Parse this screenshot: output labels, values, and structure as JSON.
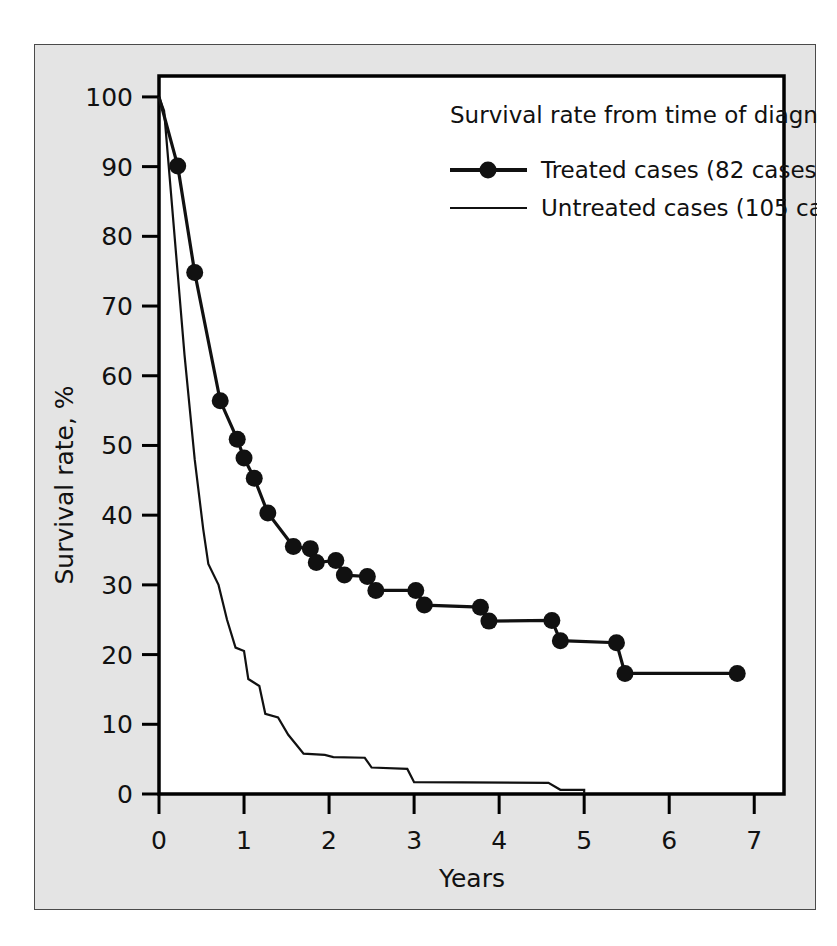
{
  "figure": {
    "background_color": "#e4e4e4",
    "border_color": "#4a4a4a",
    "plot_background": "#ffffff"
  },
  "chart_data": {
    "type": "line",
    "title": "",
    "xlabel": "Years",
    "ylabel": "Survival rate, %",
    "xlim": [
      0,
      7.35
    ],
    "ylim": [
      0,
      103
    ],
    "xticks": [
      0,
      1,
      2,
      3,
      4,
      5,
      6,
      7
    ],
    "xticklabels": [
      "0",
      "1",
      "2",
      "3",
      "4",
      "5",
      "6",
      "7"
    ],
    "yticks": [
      0,
      10,
      20,
      30,
      40,
      50,
      60,
      70,
      80,
      90,
      100
    ],
    "yticklabels": [
      "0",
      "10",
      "20",
      "30",
      "40",
      "50",
      "60",
      "70",
      "80",
      "90",
      "100"
    ],
    "grid": false,
    "legend": {
      "title": "Survival rate from time of diagnosis",
      "position": "upper-right",
      "entries": [
        {
          "label": "Treated cases (82 cases)",
          "marker": "filled-circle",
          "line": "solid-thick",
          "color": "#111111"
        },
        {
          "label": "Untreated cases (105 cases)",
          "marker": "none",
          "line": "solid-thin",
          "color": "#111111"
        }
      ]
    },
    "series": [
      {
        "name": "Treated cases (82 cases)",
        "n_cases": 82,
        "marker": "filled-circle",
        "points": [
          [
            0.0,
            100.0
          ],
          [
            0.22,
            90.1
          ],
          [
            0.42,
            74.8
          ],
          [
            0.72,
            56.4
          ],
          [
            0.92,
            50.9
          ],
          [
            1.0,
            48.2
          ],
          [
            1.12,
            45.3
          ],
          [
            1.28,
            40.3
          ],
          [
            1.58,
            35.5
          ],
          [
            1.78,
            35.2
          ],
          [
            1.85,
            33.2
          ],
          [
            2.08,
            33.5
          ],
          [
            2.18,
            31.4
          ],
          [
            2.45,
            31.2
          ],
          [
            2.55,
            29.2
          ],
          [
            3.02,
            29.2
          ],
          [
            3.12,
            27.1
          ],
          [
            3.78,
            26.8
          ],
          [
            3.88,
            24.8
          ],
          [
            4.62,
            24.9
          ],
          [
            4.72,
            22.0
          ],
          [
            5.38,
            21.7
          ],
          [
            5.48,
            17.3
          ],
          [
            6.8,
            17.3
          ]
        ]
      },
      {
        "name": "Untreated cases (105 cases)",
        "n_cases": 105,
        "marker": "none",
        "points": [
          [
            0.0,
            100.0
          ],
          [
            0.06,
            98.0
          ],
          [
            0.3,
            63.0
          ],
          [
            0.42,
            48.0
          ],
          [
            0.52,
            38.0
          ],
          [
            0.58,
            33.0
          ],
          [
            0.7,
            30.0
          ],
          [
            0.8,
            25.0
          ],
          [
            0.9,
            21.0
          ],
          [
            1.0,
            20.5
          ],
          [
            1.05,
            16.5
          ],
          [
            1.18,
            15.5
          ],
          [
            1.25,
            11.5
          ],
          [
            1.4,
            11.0
          ],
          [
            1.52,
            8.5
          ],
          [
            1.62,
            7.0
          ],
          [
            1.7,
            5.8
          ],
          [
            1.95,
            5.6
          ],
          [
            2.05,
            5.3
          ],
          [
            2.42,
            5.2
          ],
          [
            2.5,
            3.8
          ],
          [
            2.92,
            3.6
          ],
          [
            3.0,
            1.7
          ],
          [
            4.58,
            1.6
          ],
          [
            4.72,
            0.6
          ],
          [
            5.0,
            0.6
          ],
          [
            5.0,
            0.0
          ]
        ]
      }
    ]
  }
}
